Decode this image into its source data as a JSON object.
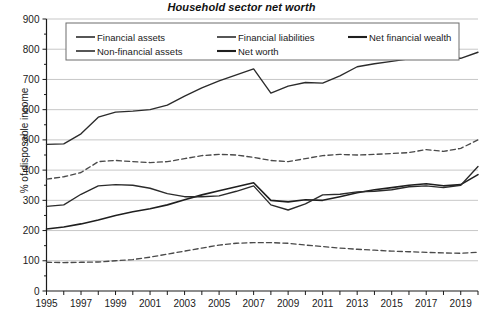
{
  "chart_data": {
    "type": "line",
    "title": "Household sector net worth",
    "xlabel": "",
    "ylabel": "% of disposable income",
    "xlim": [
      1995,
      2020
    ],
    "ylim": [
      0,
      900
    ],
    "ytick_step": 100,
    "grid": true,
    "legend_position": "top-inside",
    "x": [
      1995,
      1996,
      1997,
      1998,
      1999,
      2000,
      2001,
      2002,
      2003,
      2004,
      2005,
      2006,
      2007,
      2008,
      2009,
      2010,
      2011,
      2012,
      2013,
      2014,
      2015,
      2016,
      2017,
      2018,
      2019,
      2020
    ],
    "yticks": [
      0,
      100,
      200,
      300,
      400,
      500,
      600,
      700,
      800,
      900
    ],
    "xticks": [
      1995,
      1997,
      1999,
      2001,
      2003,
      2005,
      2007,
      2009,
      2011,
      2013,
      2015,
      2017,
      2019
    ],
    "xticklabels": [
      "1995",
      "1997",
      "1999",
      "2001",
      "2003",
      "2005",
      "2007",
      "2009",
      "2011",
      "2013",
      "2015",
      "2017",
      "2019"
    ],
    "series": [
      {
        "name": "Financial assets",
        "style": "solid",
        "values": [
          485,
          487,
          520,
          575,
          592,
          595,
          600,
          615,
          645,
          672,
          695,
          715,
          735,
          655,
          678,
          690,
          688,
          712,
          742,
          752,
          760,
          768,
          785,
          772,
          770,
          790
        ]
      },
      {
        "name": "Financial liabilities",
        "style": "dashed",
        "values": [
          95,
          94,
          95,
          96,
          100,
          104,
          112,
          122,
          132,
          142,
          152,
          158,
          160,
          160,
          158,
          152,
          147,
          142,
          138,
          135,
          132,
          130,
          128,
          126,
          125,
          128
        ]
      },
      {
        "name": "Net financial wealth",
        "style": "solid-thick",
        "values": [
          205,
          212,
          222,
          235,
          250,
          262,
          272,
          285,
          302,
          318,
          332,
          345,
          358,
          300,
          295,
          302,
          300,
          312,
          325,
          335,
          342,
          350,
          355,
          348,
          352,
          385
        ]
      },
      {
        "name": "Non-financial assets",
        "style": "dashed",
        "values": [
          370,
          378,
          392,
          428,
          432,
          428,
          425,
          428,
          438,
          448,
          452,
          450,
          442,
          432,
          428,
          438,
          448,
          452,
          450,
          452,
          455,
          458,
          468,
          462,
          472,
          500
        ]
      },
      {
        "name": "Net worth",
        "style": "solid",
        "values": [
          280,
          285,
          320,
          348,
          352,
          350,
          340,
          322,
          312,
          312,
          315,
          330,
          348,
          285,
          268,
          288,
          318,
          320,
          328,
          330,
          335,
          345,
          348,
          342,
          350,
          412
        ]
      }
    ],
    "legend_entries": [
      {
        "label": "Financial assets",
        "style": "solid"
      },
      {
        "label": "Financial liabilities",
        "style": "solid-grey"
      },
      {
        "label": "Net financial wealth",
        "style": "solid-thick"
      },
      {
        "label": "Non-financial assets",
        "style": "solid"
      },
      {
        "label": "Net worth",
        "style": "solid-thick"
      }
    ]
  }
}
